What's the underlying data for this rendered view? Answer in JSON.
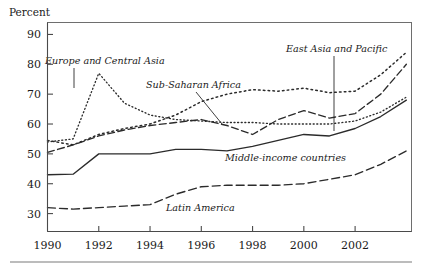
{
  "figure": {
    "y_axis_title": "Percent",
    "background_color": "#ffffff",
    "line_color": "#2b2b2b"
  },
  "chart_data": {
    "type": "line",
    "title": "",
    "subtitle": "",
    "xlabel": "",
    "ylabel": "Percent",
    "xlim": [
      1990,
      2004.2
    ],
    "ylim": [
      24,
      94
    ],
    "ytick_labels": [
      "30",
      "40",
      "50",
      "60",
      "70",
      "80",
      "90"
    ],
    "ytick_values": [
      30,
      40,
      50,
      60,
      70,
      80,
      90
    ],
    "xtick_labels": [
      "1990",
      "1992",
      "1994",
      "1996",
      "1998",
      "2000",
      "2002"
    ],
    "xtick_values": [
      1990,
      1992,
      1994,
      1996,
      1998,
      2000,
      2002
    ],
    "grid": false,
    "legend_position": "inline-annotations",
    "x": [
      1990,
      1991,
      1992,
      1993,
      1994,
      1995,
      1996,
      1997,
      1998,
      1999,
      2000,
      2001,
      2002,
      2003,
      2004
    ],
    "series": [
      {
        "name": "Europe and Central Asia",
        "style": "fine-dotted",
        "dash": "1,2.6",
        "width": 1.35,
        "values": [
          54.0,
          55.0,
          77.0,
          67.0,
          63.0,
          61.5,
          61.0,
          60.5,
          60.5,
          60.0,
          60.0,
          60.0,
          61.0,
          64.0,
          69.0
        ]
      },
      {
        "name": "Sub-Saharan Africa",
        "style": "coarse-dotted",
        "dash": "1.6,3.2",
        "width": 1.5,
        "values": [
          54.5,
          53.0,
          56.5,
          58.5,
          60.0,
          63.0,
          67.5,
          70.0,
          71.5,
          71.0,
          72.0,
          70.5,
          71.0,
          76.5,
          84.0
        ]
      },
      {
        "name": "East Asia and Pacific",
        "style": "dashed",
        "dash": "7,3.5",
        "width": 1.35,
        "values": [
          50.5,
          53.0,
          56.0,
          58.0,
          59.5,
          60.5,
          61.5,
          59.5,
          56.5,
          61.5,
          64.5,
          62.0,
          63.5,
          70.0,
          80.0
        ]
      },
      {
        "name": "Middle-income countries",
        "style": "solid",
        "dash": "",
        "width": 1.35,
        "values": [
          43.0,
          43.2,
          50.0,
          50.0,
          50.0,
          51.5,
          51.5,
          51.0,
          52.5,
          54.5,
          56.5,
          56.0,
          58.5,
          62.5,
          68.0
        ]
      },
      {
        "name": "Latin America",
        "style": "long-dashed",
        "dash": "8,4",
        "width": 1.35,
        "values": [
          32.0,
          31.5,
          32.0,
          32.5,
          33.0,
          36.5,
          39.0,
          39.5,
          39.5,
          39.5,
          40.0,
          41.5,
          43.0,
          46.5,
          51.0
        ]
      }
    ],
    "annotations": [
      {
        "text": "Europe and Central Asia",
        "label_x": 45,
        "label_y": 64,
        "leader": [
          74,
          68,
          74,
          88
        ]
      },
      {
        "text": "Sub-Saharan Africa",
        "label_x": 146,
        "label_y": 88,
        "leader": [
          196,
          92,
          222,
          124
        ]
      },
      {
        "text": "East Asia and Pacific",
        "label_x": 286,
        "label_y": 52,
        "leader": [
          334,
          56,
          334,
          131
        ]
      },
      {
        "text": "Middle-income countries",
        "label_x": 225,
        "label_y": 161,
        "leader": null
      },
      {
        "text": "Latin America",
        "label_x": 166,
        "label_y": 211,
        "leader": null
      }
    ]
  }
}
